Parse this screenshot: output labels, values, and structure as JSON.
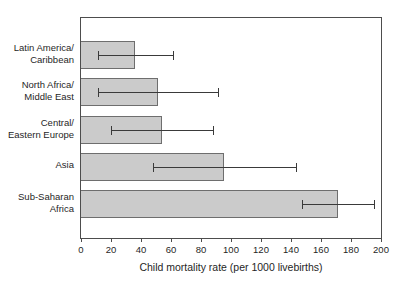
{
  "chart_data": {
    "type": "bar",
    "orientation": "horizontal",
    "title": "",
    "xlabel": "Child mortality rate (per 1000 livebirths)",
    "ylabel": "",
    "xlim": [
      0,
      200
    ],
    "xticks": [
      0,
      20,
      40,
      60,
      80,
      100,
      120,
      140,
      160,
      180,
      200
    ],
    "grid": "off",
    "legend": "none",
    "categories": [
      "Latin America/Caribbean",
      "North Africa/Middle East",
      "Central/Eastern Europe",
      "Asia",
      "Sub-Saharan Africa"
    ],
    "category_label_lines": [
      [
        "Latin America/",
        "Caribbean"
      ],
      [
        "North Africa/",
        "Middle East"
      ],
      [
        "Central/",
        "Eastern Europe"
      ],
      [
        "Asia"
      ],
      [
        "Sub-Saharan",
        "Africa"
      ]
    ],
    "series": [
      {
        "name": "Child mortality rate",
        "values": [
          36,
          51,
          54,
          95,
          171
        ],
        "error_low": [
          11,
          11,
          20,
          48,
          147
        ],
        "error_high": [
          61,
          91,
          88,
          143,
          195
        ]
      }
    ],
    "colors": {
      "bar_fill": "#cbcbcb",
      "bar_border": "#6e6e6e",
      "error_bar": "#3a3a3a",
      "frame": "#4d4d4d",
      "text": "#1f1f1f",
      "background": "#ffffff"
    }
  }
}
